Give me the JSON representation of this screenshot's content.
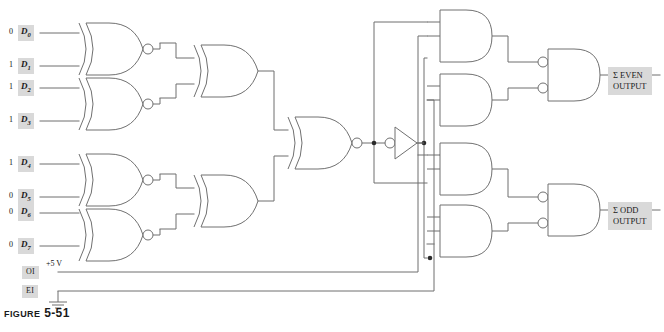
{
  "figure": {
    "caption_word": "Figure",
    "caption_number": "5-51"
  },
  "colors": {
    "wire": "#6e6e6e",
    "gate_outline": "#707070",
    "label_bg": "#d9d9d9",
    "text": "#1a1a1a",
    "page_bg": "#ffffff"
  },
  "inputs": {
    "data": [
      {
        "name": "D",
        "index": "0",
        "value": "0"
      },
      {
        "name": "D",
        "index": "1",
        "value": "1"
      },
      {
        "name": "D",
        "index": "2",
        "value": "1"
      },
      {
        "name": "D",
        "index": "3",
        "value": "1"
      },
      {
        "name": "D",
        "index": "4",
        "value": "1"
      },
      {
        "name": "D",
        "index": "5",
        "value": "0"
      },
      {
        "name": "D",
        "index": "6",
        "value": "0"
      },
      {
        "name": "D",
        "index": "7",
        "value": "0"
      }
    ],
    "control": [
      {
        "label": "OI",
        "annotation": "+5 V"
      },
      {
        "label": "EI",
        "annotation": ""
      }
    ]
  },
  "outputs": [
    {
      "line1": "Σ EVEN",
      "line2": "OUTPUT"
    },
    {
      "line1": "Σ ODD",
      "line2": "OUTPUT"
    }
  ],
  "gates": {
    "stage1": [
      "xnor-gate-d0d1",
      "xnor-gate-d2d3",
      "xnor-gate-d4d5",
      "xnor-gate-d6d7"
    ],
    "stage2": [
      "xor-gate-upper",
      "xor-gate-lower"
    ],
    "stage3": [
      "xnor-gate-final"
    ],
    "inverter": "inverter-gate",
    "and_gates": [
      "and-gate-1",
      "and-gate-2",
      "and-gate-3",
      "and-gate-4"
    ],
    "neg_and_gates": [
      "negative-and-gate-even",
      "negative-and-gate-odd"
    ]
  },
  "symbols": {
    "ground": "ground-symbol"
  }
}
